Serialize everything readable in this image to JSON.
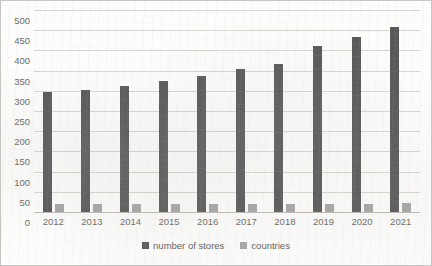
{
  "chart_data": {
    "type": "bar",
    "title": "",
    "xlabel": "",
    "ylabel": "",
    "categories": [
      "2012",
      "2013",
      "2014",
      "2015",
      "2016",
      "2017",
      "2018",
      "2019",
      "2020",
      "2021"
    ],
    "series": [
      {
        "name": "number of stores",
        "color": "#595959",
        "values": [
          297,
          301,
          311,
          325,
          336,
          353,
          366,
          410,
          434,
          458
        ]
      },
      {
        "name": "countries",
        "color": "#a6a6a6",
        "values": [
          20,
          20,
          20,
          20,
          20,
          20,
          20,
          21,
          21,
          22
        ]
      }
    ],
    "ylim": [
      0,
      500
    ],
    "ytick_values": [
      0,
      50,
      100,
      150,
      200,
      250,
      300,
      350,
      400,
      450,
      500
    ],
    "ytick_labels": [
      "0",
      "50",
      "100",
      "150",
      "200",
      "250",
      "300",
      "350",
      "400",
      "450",
      "500"
    ],
    "grid": true,
    "legend_position": "bottom"
  },
  "legend": {
    "items": [
      {
        "label": "number of stores"
      },
      {
        "label": "countries"
      }
    ]
  },
  "colors": {
    "stores": "#595959",
    "countries": "#a6a6a6",
    "gridline": "#d8d6d2",
    "border": "#c9c7c3",
    "text": "#6b6966",
    "background": "#fdfdfc"
  }
}
